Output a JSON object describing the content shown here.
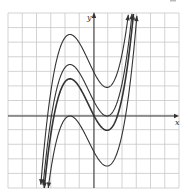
{
  "chart_data": {
    "type": "line",
    "title": "",
    "xlabel": "x",
    "ylabel": "y",
    "grid": true,
    "grid_color": "#c8c8c8",
    "axis_color": "#333333",
    "curve_color": "#333333",
    "xlim": [
      -6,
      6
    ],
    "ylim": [
      -5,
      7
    ],
    "pixel_frame": {
      "left": 8,
      "top": 13,
      "right": 179,
      "bottom": 188,
      "origin_x": 94,
      "origin_y": 116,
      "unit": 14.3
    },
    "base_function": "cubic with local max at x≈-1.7 and local min at x≈0.9 (rise ≈3.6 units between extrema)",
    "local_max_x": -1.68,
    "local_min_x": 0.91,
    "series": [
      {
        "name": "curve-1",
        "local_max_y": 5.7,
        "local_min_y": 2.0,
        "stroke_width": 1.1
      },
      {
        "name": "curve-2",
        "local_max_y": 3.6,
        "local_min_y": 0.0,
        "stroke_width": 1.1
      },
      {
        "name": "curve-3",
        "local_max_y": 2.6,
        "local_min_y": -1.0,
        "stroke_width": 1.6
      },
      {
        "name": "curve-4",
        "local_max_y": 0.0,
        "local_min_y": -3.5,
        "stroke_width": 1.1
      }
    ],
    "end_arrows": true
  },
  "labels": {
    "x_axis": "x",
    "y_axis": "y"
  }
}
